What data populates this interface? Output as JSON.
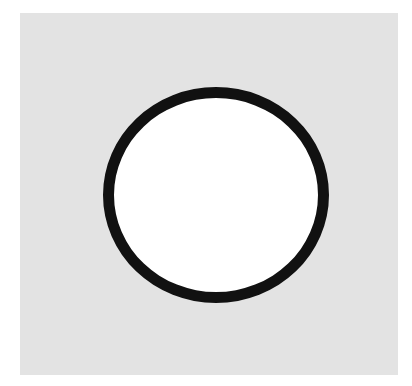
{
  "figure": {
    "shape": "circle-outline",
    "colors": {
      "page_background": "#ffffff",
      "panel_background": "#e3e3e3",
      "ring_stroke": "#111111",
      "ring_fill": "#ffffff"
    }
  }
}
